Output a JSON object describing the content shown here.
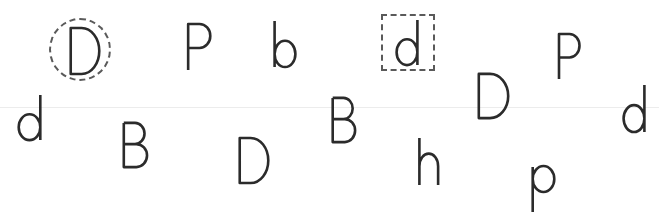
{
  "game": {
    "type": "letter-discrimination",
    "stroke_color": "#2b2b2b",
    "mark_color": "#5a5a5a",
    "guide_color": "#ececec",
    "guide_line_y": 107
  },
  "marks": [
    {
      "shape": "circle",
      "target_index": 0,
      "x": 49,
      "y": 18,
      "w": 62,
      "h": 63
    },
    {
      "shape": "box",
      "target_index": 3,
      "x": 381,
      "y": 14,
      "w": 54,
      "h": 57
    }
  ],
  "letters": [
    {
      "char": "D",
      "x": 68,
      "y": 27,
      "w": 34,
      "h": 48,
      "marked": "circle"
    },
    {
      "char": "P",
      "x": 186,
      "y": 23,
      "w": 27,
      "h": 48,
      "marked": null
    },
    {
      "char": "b",
      "x": 272,
      "y": 21,
      "w": 26,
      "h": 47,
      "marked": null
    },
    {
      "char": "d",
      "x": 394,
      "y": 20,
      "w": 26,
      "h": 46,
      "marked": "box"
    },
    {
      "char": "P",
      "x": 557,
      "y": 33,
      "w": 25,
      "h": 47,
      "marked": null
    },
    {
      "char": "D",
      "x": 476,
      "y": 73,
      "w": 35,
      "h": 46,
      "marked": null
    },
    {
      "char": "d",
      "x": 16,
      "y": 95,
      "w": 27,
      "h": 46,
      "marked": null
    },
    {
      "char": "B",
      "x": 330,
      "y": 97,
      "w": 27,
      "h": 46,
      "marked": null
    },
    {
      "char": "d",
      "x": 621,
      "y": 85,
      "w": 26,
      "h": 48,
      "marked": null
    },
    {
      "char": "B",
      "x": 121,
      "y": 122,
      "w": 28,
      "h": 46,
      "marked": null
    },
    {
      "char": "D",
      "x": 237,
      "y": 137,
      "w": 34,
      "h": 47,
      "marked": null
    },
    {
      "char": "h",
      "x": 417,
      "y": 138,
      "w": 24,
      "h": 47,
      "marked": null
    },
    {
      "char": "p",
      "x": 530,
      "y": 162,
      "w": 27,
      "h": 50,
      "marked": null
    }
  ]
}
